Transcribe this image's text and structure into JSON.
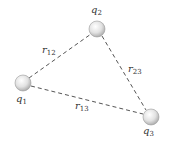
{
  "diagram": {
    "title": "",
    "charges": [
      {
        "id": "q1",
        "symbol": "q",
        "subscript": "1",
        "cx": 23,
        "cy": 83,
        "r": 8,
        "label_x": 17,
        "label_y": 103
      },
      {
        "id": "q2",
        "symbol": "q",
        "subscript": "2",
        "cx": 97,
        "cy": 29,
        "r": 8,
        "label_x": 92,
        "label_y": 13
      },
      {
        "id": "q3",
        "symbol": "q",
        "subscript": "3",
        "cx": 151,
        "cy": 117,
        "r": 8,
        "label_x": 144,
        "label_y": 135
      }
    ],
    "distances": [
      {
        "id": "r12",
        "symbol": "r",
        "subscript": "12",
        "from": "q1",
        "to": "q2",
        "label_x": 42,
        "label_y": 54
      },
      {
        "id": "r23",
        "symbol": "r",
        "subscript": "23",
        "from": "q2",
        "to": "q3",
        "label_x": 128,
        "label_y": 73
      },
      {
        "id": "r13",
        "symbol": "r",
        "subscript": "13",
        "from": "q1",
        "to": "q3",
        "label_x": 75,
        "label_y": 110
      }
    ],
    "colors": {
      "line": "#555555",
      "sphere_light": "#ffffff",
      "sphere_dark": "#b8b8b8",
      "sphere_edge": "#9a9a9a",
      "text": "#333333"
    }
  }
}
